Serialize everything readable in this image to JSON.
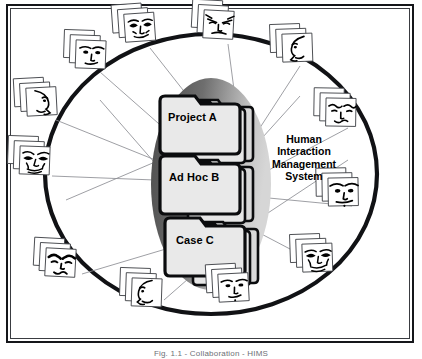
{
  "figure": {
    "caption": "Fig. 1.1 - Collaboration - HIMS"
  },
  "center": {
    "label_lines": [
      "Human",
      "Interaction",
      "Management",
      "System"
    ],
    "ellipse": {
      "fill_dark": "#565656",
      "fill_light": "#cfcfcf",
      "shape": "ellipse"
    }
  },
  "folders": [
    {
      "id": "project-a",
      "label": "Project A",
      "x": 168,
      "y": 111
    },
    {
      "id": "ad-hoc-b",
      "label": "Ad Hoc B",
      "x": 169,
      "y": 171
    },
    {
      "id": "case-c",
      "label": "Case C",
      "x": 176,
      "y": 234
    }
  ],
  "ring": {
    "color": "#111215",
    "description": "thick black circular ring connecting participant card stacks"
  },
  "participants": [
    {
      "id": "p01",
      "name": "participant-card-stack-top-left",
      "x": 128,
      "y": 18,
      "rot": -4,
      "face": "old-frowning"
    },
    {
      "id": "p02",
      "name": "participant-card-stack-top-center",
      "x": 208,
      "y": 14,
      "rot": 3,
      "face": "angry-brows"
    },
    {
      "id": "p03",
      "name": "participant-card-stack-top-right",
      "x": 286,
      "y": 38,
      "rot": -2,
      "face": "profile-left"
    },
    {
      "id": "p04",
      "name": "participant-card-stack-upper-left",
      "x": 80,
      "y": 44,
      "rot": 2,
      "face": "calm-front"
    },
    {
      "id": "p05",
      "name": "participant-card-stack-right-upper",
      "x": 330,
      "y": 102,
      "rot": 1,
      "face": "wavy-brows"
    },
    {
      "id": "p06",
      "name": "participant-card-stack-left-upper",
      "x": 30,
      "y": 92,
      "rot": -3,
      "face": "profile-right"
    },
    {
      "id": "p07",
      "name": "participant-card-stack-left-lower",
      "x": 24,
      "y": 150,
      "rot": 2,
      "face": "wrinkled"
    },
    {
      "id": "p08",
      "name": "participant-card-stack-right-lower",
      "x": 332,
      "y": 182,
      "rot": -1,
      "face": "stern-front"
    },
    {
      "id": "p09",
      "name": "participant-card-stack-bottom-left",
      "x": 50,
      "y": 252,
      "rot": 3,
      "face": "thick-brows"
    },
    {
      "id": "p10",
      "name": "participant-card-stack-bottom-right",
      "x": 306,
      "y": 248,
      "rot": -2,
      "face": "aged-front"
    },
    {
      "id": "p11",
      "name": "participant-card-stack-bottom-center-l",
      "x": 136,
      "y": 282,
      "rot": 2,
      "face": "profile-smile"
    },
    {
      "id": "p12",
      "name": "participant-card-stack-bottom-center-r",
      "x": 222,
      "y": 278,
      "rot": -3,
      "face": "young-front"
    }
  ],
  "connectors": {
    "color": "#8c8e93",
    "description": "thin gray lines linking participant card stacks to central folders"
  }
}
